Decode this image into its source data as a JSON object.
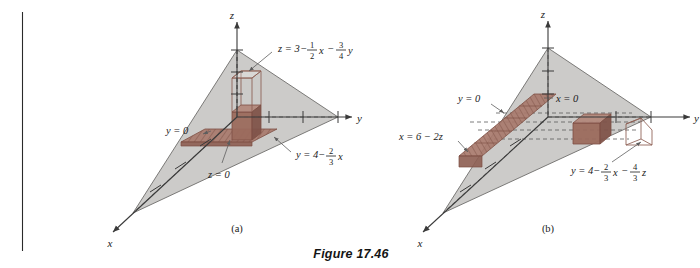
{
  "figure": {
    "caption": "Figure 17.46",
    "panels": [
      {
        "tag": "(a)",
        "axes": {
          "x": "x",
          "y": "y",
          "z": "z"
        },
        "labels": [
          {
            "name": "surface-equation",
            "parts": [
              "z",
              "=",
              "3",
              "−",
              "1/2",
              "x",
              "−",
              "3/4",
              "y"
            ],
            "plain": "z = 3 − (1/2)x − (3/4)y"
          },
          {
            "name": "plane-y-equals-zero",
            "plain": "y = 0"
          },
          {
            "name": "plane-z-equals-zero",
            "plain": "z = 0"
          },
          {
            "name": "line-y-equation",
            "parts": [
              "y",
              "=",
              "4",
              "−",
              "2/3",
              "x"
            ],
            "plain": "y = 4 − (2/3)x"
          }
        ]
      },
      {
        "tag": "(b)",
        "axes": {
          "x": "x",
          "y": "y",
          "z": "z"
        },
        "labels": [
          {
            "name": "plane-y-equals-zero",
            "plain": "y = 0"
          },
          {
            "name": "plane-x-equals-zero",
            "plain": "x = 0"
          },
          {
            "name": "line-x-equation",
            "plain": "x = 6 − 2z"
          },
          {
            "name": "surface-equation",
            "parts": [
              "y",
              "=",
              "4",
              "−",
              "2/3",
              "x",
              "−",
              "4/3",
              "z"
            ],
            "plain": "y = 4 − (2/3)x − (4/3)z"
          }
        ]
      }
    ]
  },
  "text": {
    "caption": "Figure 17.46",
    "tag_a": "(a)",
    "tag_b": "(b)",
    "axis_x": "x",
    "axis_y": "y",
    "axis_z": "z",
    "a_eq_z_lhs": "z = 3",
    "minus": "−",
    "a_eq_x_var": "x",
    "a_eq_y_var": "y",
    "one": "1",
    "two": "2",
    "three": "3",
    "four": "4",
    "y_eq_0": "y = 0",
    "z_eq_0": "z = 0",
    "x_eq_0": "x = 0",
    "a_eq_y_lhs": "y = 4",
    "b_eq_x": "x = 6 − 2z",
    "b_eq_y_lhs": "y = 4",
    "b_eq_z_var": "z"
  },
  "colors": {
    "plane_fill": "#c9c8c6",
    "plane_stroke": "#6e6d6b",
    "solid_red": "#9b6a5d",
    "solid_red_dark": "#7d4f44",
    "outline_red": "#8d5d51",
    "slab_red": "#a8796c",
    "axis": "#3a3a3a",
    "dashed": "#5a5a5a",
    "leader": "#5e5e5e",
    "rule": "#2a2a2a",
    "text": "#1a1a1a"
  }
}
